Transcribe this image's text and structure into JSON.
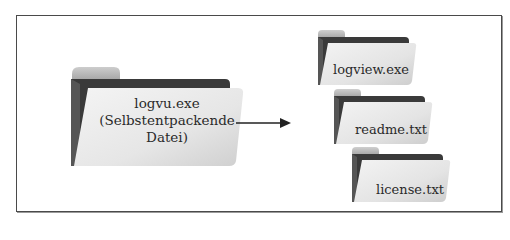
{
  "diagram": {
    "source": {
      "line1": "logvu.exe",
      "line2": "(Selbstentpackende",
      "line3": "Datei)",
      "icon": "folder-icon"
    },
    "arrow": {
      "icon": "arrow-right-icon"
    },
    "outputs": [
      {
        "label": "logview.exe",
        "icon": "folder-icon"
      },
      {
        "label": "readme.txt",
        "icon": "folder-icon"
      },
      {
        "label": "license.txt",
        "icon": "folder-icon"
      }
    ],
    "colors": {
      "border": "#4a4a4a",
      "folder_tab": "#c4c4c4",
      "folder_back": "#3c3c3c",
      "folder_front_light": "#f2f2f2",
      "folder_front_dark": "#d2d2d2",
      "text": "#2a2a2a"
    }
  }
}
